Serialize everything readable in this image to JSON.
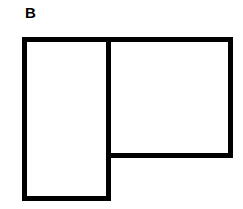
{
  "figure": {
    "panel_label": "B",
    "shapes": [
      {
        "name": "left-rectangle",
        "orientation": "tall"
      },
      {
        "name": "right-rectangle",
        "orientation": "wide"
      }
    ],
    "stroke_color": "#000000",
    "background_color": "#ffffff"
  }
}
